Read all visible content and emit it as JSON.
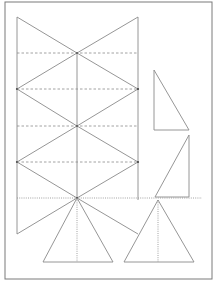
{
  "diagram": {
    "colors": {
      "background": "#ffffff",
      "stroke": "#8a8a8a",
      "border": "#7a7a7a",
      "dash": "#8a8a8a"
    },
    "border": {
      "x": 5,
      "y": 2,
      "w": 207,
      "h": 277
    },
    "main_figure": {
      "center_x": 77,
      "left_x": 17,
      "right_x": 138,
      "top_y": 17,
      "bottom_y": 234,
      "center_points_y": [
        53,
        126,
        198
      ],
      "side_points_y": [
        89,
        162
      ],
      "dashed_lines_y": [
        53,
        89,
        126,
        162
      ]
    },
    "dotted_line": {
      "y": 198,
      "x1": 17,
      "x2": 202
    },
    "right_triangle_1": {
      "points": [
        [
          154,
          70
        ],
        [
          154,
          130
        ],
        [
          189,
          130
        ]
      ]
    },
    "right_triangle_2": {
      "points": [
        [
          189,
          135
        ],
        [
          189,
          197
        ],
        [
          155,
          197
        ]
      ]
    },
    "isosceles_left": {
      "apex": [
        77,
        198
      ],
      "base_y": 262,
      "base_x1": 43,
      "base_x2": 113
    },
    "isosceles_right": {
      "apex": [
        158,
        200
      ],
      "base_y": 262,
      "base_x1": 124,
      "base_x2": 194
    }
  }
}
